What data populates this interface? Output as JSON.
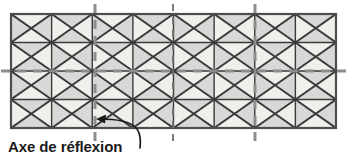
{
  "figure": {
    "title_label": "Axe de réflexion",
    "panel": {
      "x": 11,
      "y": 14,
      "width": 325,
      "height": 114,
      "columns": 8,
      "rows": 4,
      "border_color": "#4d4d4d",
      "fill_light": "#efefec",
      "fill_mid": "#d8d8d6",
      "fill_dark": "#c3c3c0",
      "line_color": "#3a3a3a"
    },
    "shading": {
      "description": "Each rectangular cell is divided by both diagonals into four triangles; triangles alternate between a near-white light tone and a medium gray tone to form a reflective tessellation.",
      "pattern_rows": [
        [
          "mid",
          "light",
          "mid",
          "light",
          "mid",
          "light",
          "mid",
          "light"
        ],
        [
          "light",
          "mid",
          "light",
          "mid",
          "light",
          "mid",
          "light",
          "mid"
        ],
        [
          "mid",
          "light",
          "mid",
          "light",
          "mid",
          "light",
          "mid",
          "light"
        ],
        [
          "light",
          "mid",
          "light",
          "mid",
          "light",
          "mid",
          "light",
          "mid"
        ]
      ]
    },
    "axes": {
      "color_major": "#8c8c8c",
      "color_minor": "#6f6f6f",
      "vertical": [
        {
          "name": "axis-vertical-1",
          "x": 95,
          "weight": "major"
        },
        {
          "name": "axis-vertical-2",
          "x": 173,
          "weight": "minor"
        },
        {
          "name": "axis-vertical-3",
          "x": 255,
          "weight": "major"
        }
      ],
      "horizontal": [
        {
          "name": "axis-horizontal-1",
          "y": 71,
          "weight": "major"
        }
      ]
    },
    "annotation": {
      "label": "Axe de réflexion",
      "arrow_target_x": 97,
      "arrow_target_y": 119,
      "leader_color": "#1a1a1a"
    }
  }
}
